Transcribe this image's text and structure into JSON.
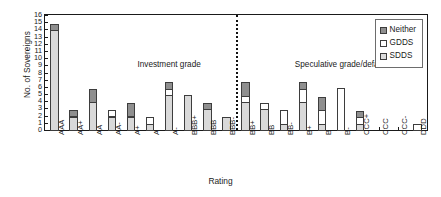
{
  "chart_data": {
    "type": "bar",
    "subtype": "stacked-bar",
    "title": "",
    "xlabel": "Rating",
    "ylabel": "No. of Sovereigns",
    "ylim": [
      0,
      16
    ],
    "ytick_step": 1,
    "yticks": [
      0,
      1,
      2,
      3,
      4,
      5,
      6,
      7,
      8,
      9,
      10,
      11,
      12,
      13,
      14,
      15,
      16
    ],
    "grid": false,
    "legend_position": "top-right",
    "categories": [
      "AAA",
      "AA+",
      "AA",
      "AA-",
      "A+",
      "A",
      "A-",
      "BBB+",
      "BBB",
      "BBB-",
      "BB+",
      "BB",
      "BB-",
      "B+",
      "B",
      "B-",
      "CCC+",
      "CCC",
      "CCC-",
      "DDD"
    ],
    "series": [
      {
        "name": "SDDS",
        "color": "#d9d9d9",
        "values": [
          14,
          2,
          4,
          2,
          2,
          1,
          5,
          5,
          3,
          2,
          4,
          3,
          1,
          4,
          1,
          0,
          1,
          0,
          0,
          0
        ]
      },
      {
        "name": "GDDS",
        "color": "#ffffff",
        "values": [
          0,
          0,
          0,
          1,
          0,
          1,
          1,
          0,
          0,
          0,
          1,
          1,
          2,
          2,
          2,
          6,
          1,
          0,
          0,
          1
        ]
      },
      {
        "name": "Neither",
        "color": "#8f8f8f",
        "values": [
          1,
          1,
          2,
          0,
          2,
          0,
          1,
          0,
          1,
          0,
          2,
          0,
          0,
          1,
          2,
          0,
          1,
          0,
          0,
          0
        ]
      }
    ],
    "totals": [
      15,
      3,
      6,
      3,
      4,
      2,
      7,
      5,
      4,
      2,
      7,
      4,
      3,
      7,
      5,
      6,
      3,
      0,
      0,
      1
    ],
    "annotations": [
      {
        "text": "Investment grade",
        "x_category_center": "A-",
        "y": 9
      },
      {
        "text": "Speculative grade/default",
        "x_category_center": "B-",
        "y": 9
      }
    ],
    "divider": {
      "between": [
        "BBB-",
        "BB+"
      ],
      "style": "dotted"
    }
  },
  "legend": {
    "items": [
      {
        "label": "Neither",
        "swatch": "neither"
      },
      {
        "label": "GDDS",
        "swatch": "gdds"
      },
      {
        "label": "SDDS",
        "swatch": "sdds"
      }
    ]
  }
}
